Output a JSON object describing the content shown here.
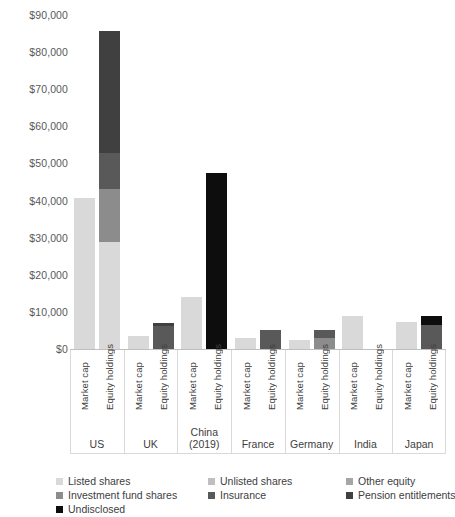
{
  "chart_data": {
    "type": "bar",
    "subtype": "stacked-bar-grouped",
    "title": "",
    "subtitle": "",
    "xlabel": "",
    "ylabel": "",
    "ylim": [
      0,
      90000
    ],
    "y_tick_labels": [
      "$0",
      "$10,000",
      "$20,000",
      "$30,000",
      "$40,000",
      "$50,000",
      "$60,000",
      "$70,000",
      "$80,000",
      "$90,000"
    ],
    "y_tick_values": [
      0,
      10000,
      20000,
      30000,
      40000,
      50000,
      60000,
      70000,
      80000,
      90000
    ],
    "units": "US$ billions",
    "grid": false,
    "legend_position": "bottom",
    "bar_labels": [
      "Market cap",
      "Equity holdings"
    ],
    "categories": [
      "US",
      "UK",
      "China (2019)",
      "France",
      "Germany",
      "India",
      "Japan"
    ],
    "series": [
      {
        "name": "Listed shares",
        "color": "#d9d9d9"
      },
      {
        "name": "Unlisted shares",
        "color": "#bfbfbf"
      },
      {
        "name": "Other equity",
        "color": "#a6a6a6"
      },
      {
        "name": "Investment fund shares",
        "color": "#8c8c8c"
      },
      {
        "name": "Insurance",
        "color": "#595959"
      },
      {
        "name": "Pension entitlements",
        "color": "#404040"
      },
      {
        "name": "Undisclosed",
        "color": "#0d0d0d"
      }
    ],
    "groups": [
      {
        "category": "US",
        "label_lines": [
          "US"
        ],
        "bars": [
          {
            "label": "Market cap",
            "total": 40700,
            "segments": [
              {
                "series": "Listed shares",
                "value": 40700
              }
            ]
          },
          {
            "label": "Equity holdings",
            "total": 85700,
            "segments": [
              {
                "series": "Listed shares",
                "value": 28800
              },
              {
                "series": "Investment fund shares",
                "value": 14400
              },
              {
                "series": "Insurance",
                "value": 9500
              },
              {
                "series": "Pension entitlements",
                "value": 33000
              }
            ]
          }
        ]
      },
      {
        "category": "UK",
        "label_lines": [
          "UK"
        ],
        "bars": [
          {
            "label": "Market cap",
            "total": 3600,
            "segments": [
              {
                "series": "Listed shares",
                "value": 3600
              }
            ]
          },
          {
            "label": "Equity holdings",
            "total": 7000,
            "segments": [
              {
                "series": "Insurance",
                "value": 6300
              },
              {
                "series": "Pension entitlements",
                "value": 700
              }
            ]
          }
        ]
      },
      {
        "category": "China (2019)",
        "label_lines": [
          "China",
          "(2019)"
        ],
        "bars": [
          {
            "label": "Market cap",
            "total": 14000,
            "segments": [
              {
                "series": "Listed shares",
                "value": 14000
              }
            ]
          },
          {
            "label": "Equity holdings",
            "total": 47500,
            "segments": [
              {
                "series": "Undisclosed",
                "value": 47500
              }
            ]
          }
        ]
      },
      {
        "category": "France",
        "label_lines": [
          "France"
        ],
        "bars": [
          {
            "label": "Market cap",
            "total": 3100,
            "segments": [
              {
                "series": "Listed shares",
                "value": 3100
              }
            ]
          },
          {
            "label": "Equity holdings",
            "total": 5000,
            "segments": [
              {
                "series": "Insurance",
                "value": 5000
              }
            ]
          }
        ]
      },
      {
        "category": "Germany",
        "label_lines": [
          "Germany"
        ],
        "bars": [
          {
            "label": "Market cap",
            "total": 2400,
            "segments": [
              {
                "series": "Listed shares",
                "value": 2400
              }
            ]
          },
          {
            "label": "Equity holdings",
            "total": 5100,
            "segments": [
              {
                "series": "Investment fund shares",
                "value": 3000
              },
              {
                "series": "Insurance",
                "value": 2100
              }
            ]
          }
        ]
      },
      {
        "category": "India",
        "label_lines": [
          "India"
        ],
        "bars": [
          {
            "label": "Market cap",
            "total": 8800,
            "segments": [
              {
                "series": "Listed shares",
                "value": 8800
              }
            ]
          },
          {
            "label": "Equity holdings",
            "total": 0,
            "segments": []
          }
        ]
      },
      {
        "category": "Japan",
        "label_lines": [
          "Japan"
        ],
        "bars": [
          {
            "label": "Market cap",
            "total": 7200,
            "segments": [
              {
                "series": "Listed shares",
                "value": 7200
              }
            ]
          },
          {
            "label": "Equity holdings",
            "total": 9000,
            "segments": [
              {
                "series": "Insurance",
                "value": 6400
              },
              {
                "series": "Undisclosed",
                "value": 2600
              }
            ]
          }
        ]
      }
    ],
    "legend": [
      {
        "label": "Listed shares",
        "color": "#d9d9d9"
      },
      {
        "label": "Unlisted shares",
        "color": "#bfbfbf"
      },
      {
        "label": "Other equity",
        "color": "#a6a6a6"
      },
      {
        "label": "Investment fund shares",
        "color": "#8c8c8c"
      },
      {
        "label": "Insurance",
        "color": "#595959"
      },
      {
        "label": "Pension entitlements",
        "color": "#404040"
      },
      {
        "label": "Undisclosed",
        "color": "#0d0d0d"
      }
    ]
  }
}
